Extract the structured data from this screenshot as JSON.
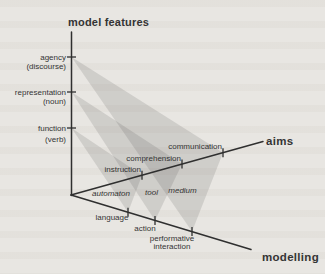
{
  "colors": {
    "background": "#e8e6e2",
    "axis_line": "#2f2f2f",
    "label_text": "#343434",
    "triangle_fill": "#4a4a4a"
  },
  "diagram": {
    "vertical_axis": {
      "title": "model features",
      "ticks": [
        {
          "label": "agency",
          "sublabel": "(discourse)"
        },
        {
          "label": "representation",
          "sublabel": "(noun)"
        },
        {
          "label": "function",
          "sublabel": "(verb)"
        }
      ]
    },
    "aims_axis": {
      "label": "aims",
      "ticks": [
        {
          "label": "instruction"
        },
        {
          "label": "comprehension"
        },
        {
          "label": "communication"
        }
      ]
    },
    "modelling_axis": {
      "label": "modelling",
      "ticks": [
        {
          "label_line1": "language",
          "label_line2": ""
        },
        {
          "label_line1": "action",
          "label_line2": ""
        },
        {
          "label_line1": "performative",
          "label_line2": "interaction"
        }
      ]
    },
    "plane_labels": [
      {
        "label": "automaton"
      },
      {
        "label": "tool"
      },
      {
        "label": "medium"
      }
    ]
  }
}
